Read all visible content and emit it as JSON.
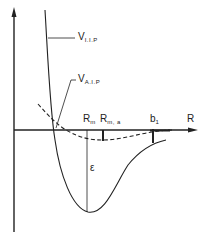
{
  "diagram": {
    "type": "potential-energy-curves",
    "axes": {
      "x_label": "R",
      "y_label": ""
    },
    "curves": [
      {
        "name": "V",
        "subscript": "I.I.P",
        "style": "solid"
      },
      {
        "name": "V",
        "subscript": "A.I.P",
        "style": "dashed"
      }
    ],
    "markers": [
      {
        "name": "R",
        "subscript": "m"
      },
      {
        "name": "R",
        "subscript": "m, a"
      },
      {
        "name": "b",
        "subscript": "1"
      }
    ],
    "well_depth_label": "ε",
    "colors": {
      "ink": "#222222",
      "background": "#ffffff"
    }
  }
}
